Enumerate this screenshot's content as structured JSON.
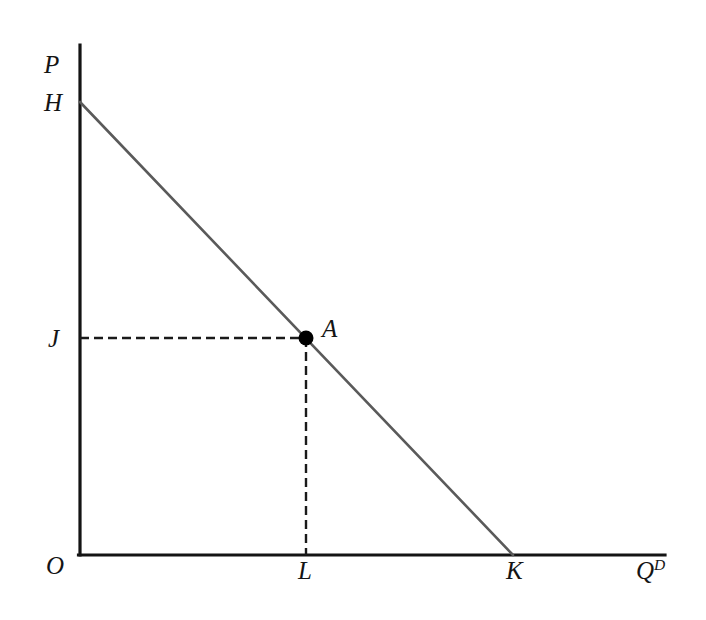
{
  "figure": {
    "background_color": "#ffffff",
    "width": 706,
    "height": 620
  },
  "axes": {
    "vertical": {
      "label": "P",
      "name": "price-axis",
      "color": "#141414",
      "x": 80,
      "y_top": 45,
      "y_bottom": 555
    },
    "horizontal": {
      "label": "Q",
      "label_superscript": "D",
      "name": "quantity-demanded-axis",
      "color": "#141414",
      "y": 555,
      "x_left": 80,
      "x_right": 665
    },
    "origin_label": "O"
  },
  "curve": {
    "name": "demand-curve",
    "color": "#5a5a5a",
    "stroke_width": 2.6,
    "vertical_intercept_label": "H",
    "horizontal_intercept_label": "K",
    "start": {
      "x": 80,
      "y": 102
    },
    "end": {
      "x": 513,
      "y": 555
    }
  },
  "point": {
    "label": "A",
    "name": "point-a",
    "color": "#000000",
    "radius": 7,
    "x": 306,
    "y": 338
  },
  "guides": {
    "color": "#1a1a1a",
    "dash": "9 5",
    "stroke_width": 2.4,
    "horizontal": {
      "price_label": "J",
      "from_x": 80,
      "to_x": 306,
      "y": 338
    },
    "vertical": {
      "quantity_label": "L",
      "x": 306,
      "from_y": 338,
      "to_y": 555
    }
  },
  "chart_data": {
    "type": "line",
    "title": "",
    "xlabel": "Q^D",
    "ylabel": "P",
    "grid": false,
    "legend": null,
    "xlim": [
      0,
      1
    ],
    "ylim": [
      0,
      1
    ],
    "series": [
      {
        "name": "Demand",
        "points": [
          {
            "x": 0.0,
            "y": 1.0,
            "label": "H"
          },
          {
            "x": 1.0,
            "y": 0.0,
            "label": "K"
          }
        ]
      }
    ],
    "annotations": [
      {
        "label": "A",
        "x": 0.522,
        "y": 0.479,
        "type": "point"
      },
      {
        "label": "J",
        "x": 0.0,
        "y": 0.479,
        "type": "axis-tick-y"
      },
      {
        "label": "L",
        "x": 0.522,
        "y": 0.0,
        "type": "axis-tick-x"
      },
      {
        "label": "O",
        "x": 0.0,
        "y": 0.0,
        "type": "origin"
      },
      {
        "label": "H",
        "x": 0.0,
        "y": 1.0,
        "type": "intercept-y"
      },
      {
        "label": "K",
        "x": 1.0,
        "y": 0.0,
        "type": "intercept-x"
      }
    ]
  }
}
